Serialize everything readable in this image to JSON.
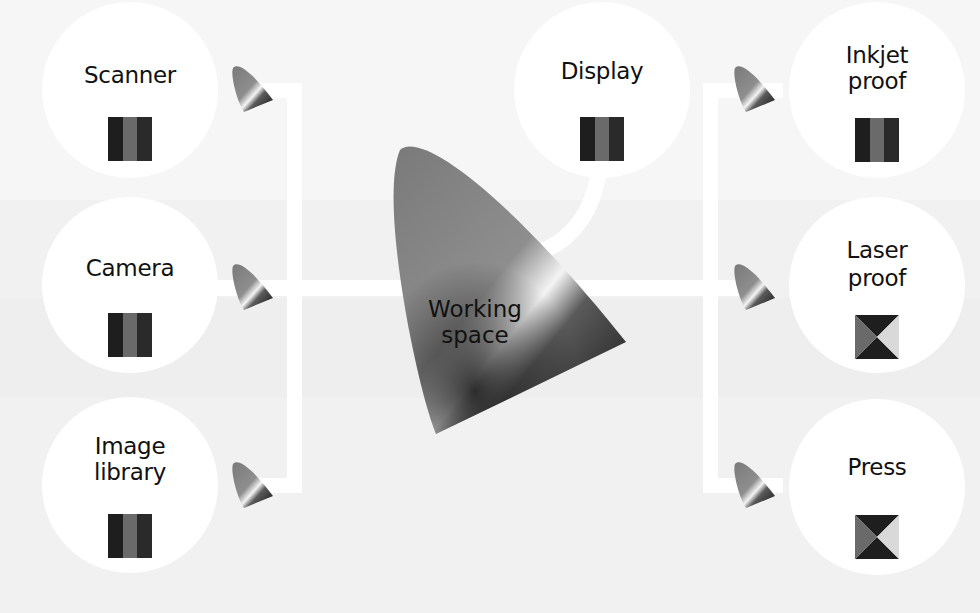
{
  "diagram": {
    "center": {
      "label_line1": "Working",
      "label_line2": "space"
    },
    "inputs": [
      {
        "id": "scanner",
        "label_line1": "Scanner",
        "label_line2": "",
        "swatch": "stripes"
      },
      {
        "id": "camera",
        "label_line1": "Camera",
        "label_line2": "",
        "swatch": "stripes"
      },
      {
        "id": "image-library",
        "label_line1": "Image",
        "label_line2": "library",
        "swatch": "stripes"
      }
    ],
    "display": {
      "id": "display",
      "label_line1": "Display",
      "label_line2": "",
      "swatch": "stripes"
    },
    "outputs": [
      {
        "id": "inkjet-proof",
        "label_line1": "Inkjet",
        "label_line2": "proof",
        "swatch": "stripes"
      },
      {
        "id": "laser-proof",
        "label_line1": "Laser",
        "label_line2": "proof",
        "swatch": "hourglass"
      },
      {
        "id": "press",
        "label_line1": "Press",
        "label_line2": "",
        "swatch": "hourglass"
      }
    ],
    "colors": {
      "background": "#f1f1f1",
      "node_fill": "#ffffff",
      "connector": "#ffffff",
      "swatch_dark": "#1e1e1e",
      "swatch_mid": "#6a6a6a",
      "swatch_light": "#d9d9d9"
    }
  }
}
